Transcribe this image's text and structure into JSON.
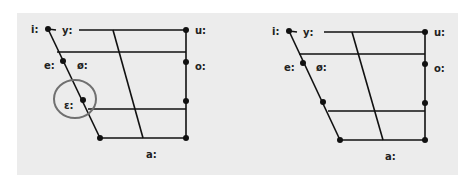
{
  "colors": {
    "background": "#ffffff",
    "panel": "#ececec",
    "line": "#111111",
    "highlight_circle": "#707070",
    "label": "#222222"
  },
  "diagram": {
    "type": "vowel-quadrilateral",
    "charts": [
      {
        "id": "left",
        "highlighted_vowel": "ɛ:",
        "labels": {
          "i": "i:",
          "y": "y:",
          "u": "u:",
          "e": "e:",
          "oe": "ø:",
          "o": "o:",
          "eps": "ɛ:",
          "a": "a:"
        }
      },
      {
        "id": "right",
        "highlighted_vowel": null,
        "labels": {
          "i": "i:",
          "y": "y:",
          "u": "u:",
          "e": "e:",
          "oe": "ø:",
          "o": "o:",
          "a": "a:"
        }
      }
    ]
  }
}
